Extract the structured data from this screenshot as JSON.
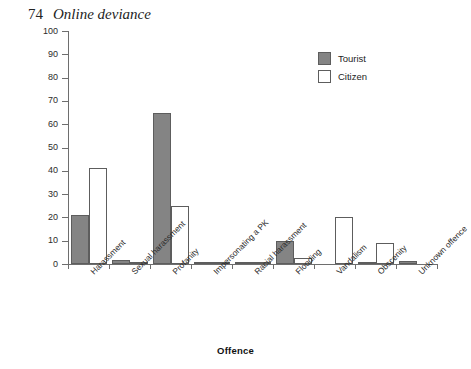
{
  "page": {
    "folio": "74",
    "running_head": "Online deviance"
  },
  "chart_data": {
    "type": "bar",
    "title": "",
    "xlabel": "Offence",
    "ylabel": "Percentage",
    "ylim": [
      0,
      100
    ],
    "ytick_step": 10,
    "yticks": [
      "0",
      "10",
      "20",
      "30",
      "40",
      "50",
      "60",
      "70",
      "80",
      "90",
      "100"
    ],
    "grid": false,
    "legend_position": "top-right",
    "categories": [
      "Harassment",
      "Sexual harassment",
      "Profanity",
      "Impersonating a PK",
      "Racial harassment",
      "Flooding",
      "Vandalism",
      "Obscenity",
      "Unknown offence"
    ],
    "series": [
      {
        "name": "Tourist",
        "color": "#848484",
        "values": [
          21,
          1.6,
          65,
          0.9,
          0.9,
          10,
          0,
          0.3,
          1.3
        ]
      },
      {
        "name": "Citizen",
        "color": "#ffffff",
        "values": [
          41,
          0.8,
          25,
          0.4,
          0.8,
          2.5,
          20,
          9,
          0
        ]
      }
    ]
  },
  "legend": {
    "items": [
      {
        "label": "Tourist"
      },
      {
        "label": "Citizen"
      }
    ]
  }
}
